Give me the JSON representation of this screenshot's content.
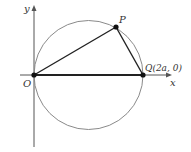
{
  "diagram": {
    "axes": {
      "x_label": "x",
      "y_label": "y"
    },
    "points": {
      "origin": {
        "label": "O"
      },
      "p": {
        "label": "P"
      },
      "q": {
        "label": "Q(2a, 0)"
      }
    },
    "colors": {
      "circle": "#8a8a8a",
      "lines": "#222222",
      "axes": "#555555"
    }
  }
}
